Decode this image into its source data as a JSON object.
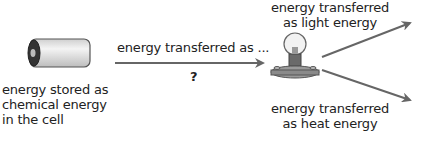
{
  "diagram": {
    "type": "energy-transfer-flow",
    "nodes": [
      {
        "id": "cell",
        "icon": "battery-cell-icon",
        "label_lines": [
          "energy stored as",
          "chemical energy",
          "in the cell"
        ]
      },
      {
        "id": "bulb",
        "icon": "light-bulb-icon"
      }
    ],
    "edges": [
      {
        "from": "cell",
        "to": "bulb",
        "label_above": "energy transferred as ...",
        "label_below": "?"
      },
      {
        "from": "bulb",
        "to": "light",
        "label_lines": [
          "energy transferred",
          "as light energy"
        ]
      },
      {
        "from": "bulb",
        "to": "heat",
        "label_lines": [
          "energy transferred",
          "as heat energy"
        ]
      }
    ]
  },
  "labels": {
    "cell_line1": "energy stored as",
    "cell_line2": "chemical energy",
    "cell_line3": "in the cell",
    "transfer_above": "energy transferred as ...",
    "transfer_below": "?",
    "light_line1": "energy transferred",
    "light_line2": "as light energy",
    "heat_line1": "energy transferred",
    "heat_line2": "as heat energy"
  },
  "colors": {
    "arrow": "#666666",
    "text": "#222222",
    "cell_body": "#e8e8e8",
    "bulb_base": "#8a8a8a"
  }
}
